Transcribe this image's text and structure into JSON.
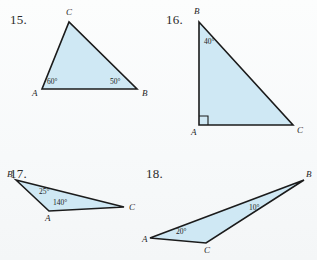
{
  "page": {
    "background_color": "#fbfcfd",
    "triangle_fill_color": "#cfe8f4",
    "triangle_stroke_color": "#1b1b1b",
    "degree_symbol": "°"
  },
  "problems": [
    {
      "number": "15.",
      "name": "problem-15",
      "shape": "triangle",
      "vertices": [
        {
          "label": "A",
          "x": 42,
          "y": 89
        },
        {
          "label": "B",
          "x": 137,
          "y": 89
        },
        {
          "label": "C",
          "x": 69,
          "y": 22
        }
      ],
      "vertex_label_positions": [
        {
          "label": "A",
          "x": 32,
          "y": 96
        },
        {
          "label": "B",
          "x": 142,
          "y": 96
        },
        {
          "label": "C",
          "x": 66,
          "y": 15
        }
      ],
      "angles": [
        {
          "at": "A",
          "value": "60°",
          "x": 47,
          "y": 84
        },
        {
          "at": "B",
          "value": "50°",
          "x": 110,
          "y": 84
        }
      ],
      "right_angle_at": null
    },
    {
      "number": "16.",
      "name": "problem-16",
      "shape": "triangle",
      "vertices": [
        {
          "label": "B",
          "x": 199,
          "y": 22
        },
        {
          "label": "A",
          "x": 199,
          "y": 125
        },
        {
          "label": "C",
          "x": 293,
          "y": 125
        }
      ],
      "vertex_label_positions": [
        {
          "label": "B",
          "x": 194,
          "y": 14
        },
        {
          "label": "A",
          "x": 191,
          "y": 135
        },
        {
          "label": "C",
          "x": 297,
          "y": 133
        }
      ],
      "angles": [
        {
          "at": "B",
          "value": "40°",
          "x": 204,
          "y": 44
        }
      ],
      "right_angle_at": "A"
    },
    {
      "number": "17.",
      "name": "problem-17",
      "shape": "triangle",
      "vertices": [
        {
          "label": "B",
          "x": 16,
          "y": 180
        },
        {
          "label": "A",
          "x": 49,
          "y": 211
        },
        {
          "label": "C",
          "x": 124,
          "y": 207
        }
      ],
      "vertex_label_positions": [
        {
          "label": "B",
          "x": 7,
          "y": 177
        },
        {
          "label": "A",
          "x": 45,
          "y": 221
        },
        {
          "label": "C",
          "x": 129,
          "y": 210
        }
      ],
      "angles": [
        {
          "at": "B",
          "value": "25°",
          "x": 39,
          "y": 194
        },
        {
          "at": "A",
          "value": "140°",
          "x": 53,
          "y": 205
        }
      ],
      "right_angle_at": null
    },
    {
      "number": "18.",
      "name": "problem-18",
      "shape": "triangle",
      "vertices": [
        {
          "label": "A",
          "x": 150,
          "y": 238
        },
        {
          "label": "B",
          "x": 304,
          "y": 180
        },
        {
          "label": "C",
          "x": 206,
          "y": 243
        }
      ],
      "vertex_label_positions": [
        {
          "label": "A",
          "x": 142,
          "y": 242
        },
        {
          "label": "B",
          "x": 306,
          "y": 177
        },
        {
          "label": "C",
          "x": 204,
          "y": 253
        }
      ],
      "angles": [
        {
          "at": "A",
          "value": "20°",
          "x": 176,
          "y": 234
        },
        {
          "at": "B",
          "value": "10°",
          "x": 249,
          "y": 210
        }
      ],
      "right_angle_at": null
    }
  ],
  "problem_number_positions": [
    {
      "for": "15.",
      "x": 10,
      "y": 12
    },
    {
      "for": "16.",
      "x": 166,
      "y": 12
    },
    {
      "for": "17.",
      "x": 10,
      "y": 166
    },
    {
      "for": "18.",
      "x": 146,
      "y": 166
    }
  ]
}
